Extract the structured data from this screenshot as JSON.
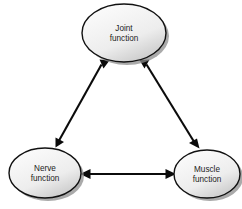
{
  "diagram": {
    "type": "triangular-relationship-diagram",
    "background_color": "#ffffff",
    "node_fill_light": "#fdfdfd",
    "node_fill_dark": "#d6d6d6",
    "node_stroke_color": "#111111",
    "shadow_color": "#8d8d8d",
    "edge_color": "#0b0b0b",
    "text_color": "#1c1c1c",
    "nodes": [
      {
        "id": "joint",
        "line1": "Joint",
        "line2": "function",
        "cx": 124,
        "cy": 33,
        "rx": 42,
        "ry": 29
      },
      {
        "id": "nerve",
        "line1": "Nerve",
        "line2": "function",
        "cx": 45,
        "cy": 173,
        "rx": 36,
        "ry": 25
      },
      {
        "id": "muscle",
        "line1": "Muscle",
        "line2": "function",
        "cx": 207,
        "cy": 174,
        "rx": 33,
        "ry": 24
      }
    ],
    "edges": [
      {
        "id": "nerve-joint",
        "from": "nerve",
        "to": "joint",
        "direction": "bidirectional"
      },
      {
        "id": "joint-muscle",
        "from": "joint",
        "to": "muscle",
        "direction": "bidirectional"
      },
      {
        "id": "nerve-muscle",
        "from": "nerve",
        "to": "muscle",
        "direction": "bidirectional"
      }
    ]
  }
}
